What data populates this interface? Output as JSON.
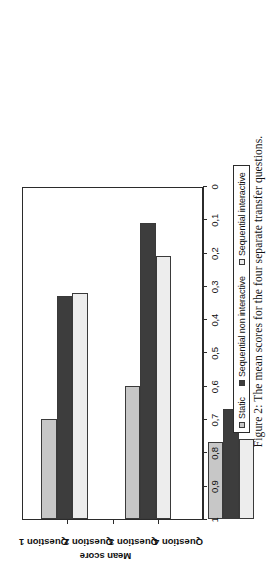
{
  "figure": {
    "caption": "Figure 2:  The mean scores for the four separate transfer questions."
  },
  "legend": {
    "items": [
      {
        "label": "Static",
        "swatch": "legend-swatch-static",
        "color": "#c7c7c7"
      },
      {
        "label": "Sequential non interactive",
        "swatch": "legend-swatch-sequential-non-interactive",
        "color": "#3d3d3d"
      },
      {
        "label": "Sequential interactive",
        "swatch": "legend-swatch-sequential-interactive",
        "color": "#ededed"
      }
    ]
  },
  "axes": {
    "ylabel": "Mean score",
    "yticks": [
      "1",
      "0,9",
      "0,8",
      "0,7",
      "0,6",
      "0,5",
      "0,4",
      "0,3",
      "0,2",
      "0,1",
      "0"
    ],
    "xcategories": [
      "Question 1",
      "Question 2",
      "Question 3",
      "Question 4"
    ]
  },
  "chart_data": {
    "type": "bar",
    "title": "",
    "subtitle": "",
    "xlabel": "",
    "ylabel": "Mean score",
    "ylim": [
      0,
      1
    ],
    "ytick_values": [
      0,
      0.1,
      0.2,
      0.3,
      0.4,
      0.5,
      0.6,
      0.7,
      0.8,
      0.9,
      1
    ],
    "ytick_labels": [
      "0",
      "0,1",
      "0,2",
      "0,3",
      "0,4",
      "0,5",
      "0,6",
      "0,7",
      "0,8",
      "0,9",
      "1"
    ],
    "grid": false,
    "orientation": "vertical",
    "legend_position": "below-right",
    "categories": [
      "Question 1",
      "Question 2",
      "Question 3",
      "Question 4"
    ],
    "series": [
      {
        "name": "Static",
        "color": "#c7c7c7",
        "values": [
          0.3,
          0.4,
          0.23,
          0.24
        ]
      },
      {
        "name": "Sequential non interactive",
        "color": "#3d3d3d",
        "values": [
          0.67,
          0.89,
          0.33,
          0.55
        ]
      },
      {
        "name": "Sequential interactive",
        "color": "#ededed",
        "values": [
          0.68,
          0.79,
          0.24,
          0.4
        ]
      }
    ]
  }
}
